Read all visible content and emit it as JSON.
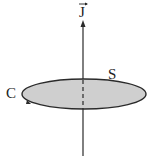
{
  "diagram": {
    "labels": {
      "vector": "J",
      "curve": "C",
      "surface": "S"
    },
    "colors": {
      "stroke": "#2a2a2a",
      "surface_fill": "#cfcfcf",
      "background": "#ffffff"
    }
  }
}
